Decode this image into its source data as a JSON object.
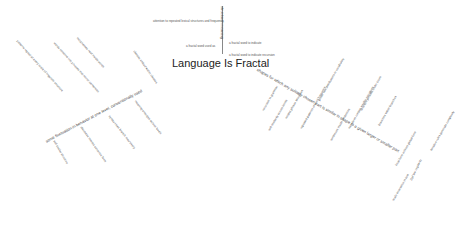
{
  "title": "Language Is Fractal",
  "top_branch": {
    "stem": "structural meaning",
    "items": [
      "attention to repeated lexical structures and frequency",
      "a fractal word to indicate",
      "a fractal word used as",
      "a fractal word to indicate recursion"
    ]
  },
  "left_branch": {
    "main": "some fluctuation in behavior at one level, conventionally used",
    "items": [
      "patterns repeat at every scale of linguistic structure",
      "words combine into phrases that mirror sentences",
      "morphemes nest inside words",
      "clauses embed within clauses",
      "self similar structure",
      "discourse mirrors sentence form",
      "syntax trees branch recursively",
      "meaning emerges across levels"
    ]
  },
  "right_branch": {
    "main": "shapes for which any suitably chosen part is similar in shape to a given larger or smaller part",
    "items": [
      "recursion in grammar",
      "self-similarity across levels",
      "nested phrase structures",
      "repeated patterns of word frequency",
      "power law distributions in vocabulary",
      "sentences inside sentences",
      "narratives contain smaller narratives",
      "structure persists under zoom",
      "branches within branches",
      "local form echoes global form",
      "scale invariance in text",
      "Zipf law regularity",
      "iterative rules generate complexity"
    ]
  }
}
